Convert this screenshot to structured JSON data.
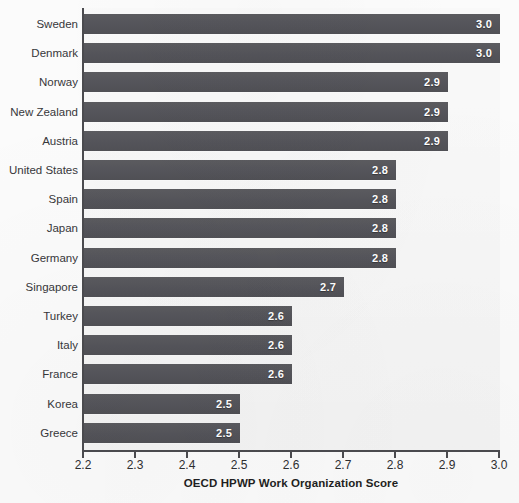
{
  "chart_data": {
    "type": "bar",
    "orientation": "horizontal",
    "title": "",
    "xlabel": "OECD HPWP Work Organization Score",
    "ylabel": "",
    "xlim": [
      2.2,
      3.0
    ],
    "xticks": [
      "2.2",
      "2.3",
      "2.4",
      "2.5",
      "2.6",
      "2.7",
      "2.8",
      "2.9",
      "3.0"
    ],
    "grid": false,
    "legend": "none",
    "categories": [
      "Sweden",
      "Denmark",
      "Norway",
      "New Zealand",
      "Austria",
      "United States",
      "Spain",
      "Japan",
      "Germany",
      "Singapore",
      "Turkey",
      "Italy",
      "France",
      "Korea",
      "Greece"
    ],
    "values": [
      3.0,
      3.0,
      2.9,
      2.9,
      2.9,
      2.8,
      2.8,
      2.8,
      2.8,
      2.7,
      2.6,
      2.6,
      2.6,
      2.5,
      2.5
    ],
    "value_labels": [
      "3.0",
      "3.0",
      "2.9",
      "2.9",
      "2.9",
      "2.8",
      "2.8",
      "2.8",
      "2.8",
      "2.7",
      "2.6",
      "2.6",
      "2.6",
      "2.5",
      "2.5"
    ],
    "colors": {
      "bar": "#56565a",
      "bar_value_text": "#ffffff",
      "category_text": "#37373a",
      "axis_line": "#4b4b4f",
      "plot_background": "#f2f2f2",
      "page_background": "#fbfbfb",
      "axis_title_text": "#1f1f22"
    }
  }
}
